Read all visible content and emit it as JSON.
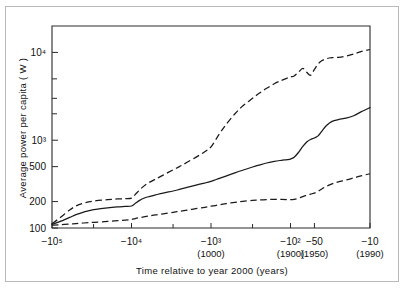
{
  "figure": {
    "background": "#ffffff",
    "border_color": "#b9b9b9",
    "line_color": "#1a1a1a"
  },
  "chart_data": {
    "type": "line",
    "title": "",
    "subtitle": "",
    "xlabel": "Time relative to year 2000 (years)",
    "ylabel": "Average power per capita ( W )",
    "xscale": "log-reversed",
    "yscale": "log",
    "grid": false,
    "legend": null,
    "xlim": [
      -100000,
      -10
    ],
    "ylim": [
      100,
      20000
    ],
    "x_tick_labels": [
      {
        "value": -100000,
        "label": "−10⁵",
        "sub": ""
      },
      {
        "value": -10000,
        "label": "−10⁴",
        "sub": ""
      },
      {
        "value": -1000,
        "label": "−10³",
        "sub": "(1000)"
      },
      {
        "value": -100,
        "label": "−10²",
        "sub": "(1900)"
      },
      {
        "value": -50,
        "label": "−50",
        "sub": "(1950)"
      },
      {
        "value": -10,
        "label": "−10",
        "sub": "(1990)"
      }
    ],
    "x_minor_ticks": [
      -30000,
      -3000,
      -300
    ],
    "y_tick_labels": [
      {
        "value": 100,
        "label": "100"
      },
      {
        "value": 200,
        "label": "200"
      },
      {
        "value": 500,
        "label": "500"
      },
      {
        "value": 1000,
        "label": "10³"
      },
      {
        "value": 10000,
        "label": "10⁴"
      }
    ],
    "y_minor_ticks": [
      2000,
      3000,
      5000
    ],
    "series": [
      {
        "name": "upper-bound",
        "style": "dashed",
        "points": [
          [
            -100000,
            112
          ],
          [
            -80000,
            130
          ],
          [
            -60000,
            160
          ],
          [
            -50000,
            178
          ],
          [
            -40000,
            192
          ],
          [
            -30000,
            203
          ],
          [
            -20000,
            210
          ],
          [
            -15000,
            214
          ],
          [
            -12000,
            216
          ],
          [
            -10000,
            219
          ],
          [
            -9000,
            240
          ],
          [
            -8000,
            268
          ],
          [
            -7000,
            300
          ],
          [
            -6000,
            330
          ],
          [
            -5000,
            360
          ],
          [
            -4000,
            400
          ],
          [
            -3000,
            460
          ],
          [
            -2500,
            500
          ],
          [
            -2000,
            560
          ],
          [
            -1500,
            650
          ],
          [
            -1200,
            740
          ],
          [
            -1000,
            840
          ],
          [
            -800,
            1150
          ],
          [
            -650,
            1500
          ],
          [
            -500,
            2000
          ],
          [
            -400,
            2450
          ],
          [
            -300,
            3000
          ],
          [
            -250,
            3400
          ],
          [
            -200,
            3900
          ],
          [
            -160,
            4400
          ],
          [
            -130,
            4800
          ],
          [
            -110,
            5100
          ],
          [
            -100,
            5250
          ],
          [
            -90,
            5400
          ],
          [
            -80,
            5900
          ],
          [
            -70,
            6600
          ],
          [
            -62,
            5900
          ],
          [
            -56,
            5500
          ],
          [
            -50,
            6400
          ],
          [
            -45,
            7400
          ],
          [
            -40,
            8100
          ],
          [
            -35,
            8500
          ],
          [
            -30,
            8700
          ],
          [
            -25,
            8800
          ],
          [
            -20,
            9100
          ],
          [
            -16,
            9600
          ],
          [
            -13,
            10200
          ],
          [
            -10,
            10800
          ]
        ]
      },
      {
        "name": "best-estimate",
        "style": "solid",
        "points": [
          [
            -100000,
            110
          ],
          [
            -80000,
            118
          ],
          [
            -60000,
            132
          ],
          [
            -50000,
            142
          ],
          [
            -40000,
            152
          ],
          [
            -30000,
            162
          ],
          [
            -20000,
            170
          ],
          [
            -15000,
            174
          ],
          [
            -12000,
            176
          ],
          [
            -10000,
            178
          ],
          [
            -9000,
            190
          ],
          [
            -8000,
            205
          ],
          [
            -7000,
            218
          ],
          [
            -6000,
            228
          ],
          [
            -5000,
            238
          ],
          [
            -4000,
            250
          ],
          [
            -3000,
            264
          ],
          [
            -2500,
            275
          ],
          [
            -2000,
            290
          ],
          [
            -1500,
            310
          ],
          [
            -1200,
            325
          ],
          [
            -1000,
            340
          ],
          [
            -800,
            365
          ],
          [
            -650,
            390
          ],
          [
            -500,
            425
          ],
          [
            -400,
            455
          ],
          [
            -300,
            495
          ],
          [
            -250,
            520
          ],
          [
            -200,
            550
          ],
          [
            -160,
            575
          ],
          [
            -130,
            590
          ],
          [
            -110,
            600
          ],
          [
            -100,
            610
          ],
          [
            -90,
            640
          ],
          [
            -80,
            720
          ],
          [
            -70,
            850
          ],
          [
            -62,
            960
          ],
          [
            -56,
            1020
          ],
          [
            -50,
            1060
          ],
          [
            -45,
            1120
          ],
          [
            -40,
            1280
          ],
          [
            -35,
            1480
          ],
          [
            -30,
            1640
          ],
          [
            -25,
            1720
          ],
          [
            -20,
            1780
          ],
          [
            -16,
            1900
          ],
          [
            -13,
            2100
          ],
          [
            -10,
            2350
          ]
        ]
      },
      {
        "name": "lower-bound",
        "style": "dashed",
        "points": [
          [
            -100000,
            108
          ],
          [
            -80000,
            109
          ],
          [
            -60000,
            111
          ],
          [
            -50000,
            112
          ],
          [
            -40000,
            114
          ],
          [
            -30000,
            116
          ],
          [
            -20000,
            119
          ],
          [
            -15000,
            121
          ],
          [
            -12000,
            123
          ],
          [
            -10000,
            125
          ],
          [
            -9000,
            128
          ],
          [
            -8000,
            131
          ],
          [
            -7000,
            134
          ],
          [
            -6000,
            137
          ],
          [
            -5000,
            141
          ],
          [
            -4000,
            145
          ],
          [
            -3000,
            151
          ],
          [
            -2500,
            155
          ],
          [
            -2000,
            160
          ],
          [
            -1500,
            167
          ],
          [
            -1200,
            172
          ],
          [
            -1000,
            177
          ],
          [
            -800,
            183
          ],
          [
            -650,
            189
          ],
          [
            -500,
            196
          ],
          [
            -400,
            201
          ],
          [
            -300,
            206
          ],
          [
            -250,
            209
          ],
          [
            -200,
            211
          ],
          [
            -160,
            212
          ],
          [
            -130,
            212
          ],
          [
            -110,
            211
          ],
          [
            -100,
            210
          ],
          [
            -90,
            212
          ],
          [
            -80,
            218
          ],
          [
            -70,
            228
          ],
          [
            -62,
            236
          ],
          [
            -56,
            243
          ],
          [
            -50,
            250
          ],
          [
            -45,
            262
          ],
          [
            -40,
            280
          ],
          [
            -35,
            300
          ],
          [
            -30,
            318
          ],
          [
            -25,
            335
          ],
          [
            -20,
            352
          ],
          [
            -16,
            372
          ],
          [
            -13,
            392
          ],
          [
            -10,
            415
          ]
        ]
      }
    ]
  }
}
